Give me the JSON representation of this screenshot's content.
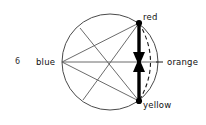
{
  "figure": {
    "number": "6",
    "type": "diagram"
  },
  "labels": {
    "red": "red",
    "yellow": "yellow",
    "orange": "orange",
    "blue": "blue"
  },
  "colors": {
    "stroke": "#1a1a1a",
    "thin_stroke": "#555555",
    "background": "#ffffff",
    "text": "#111111"
  },
  "geometry": {
    "circle": {
      "cx": 110,
      "cy": 62,
      "r": 48
    },
    "nodes": [
      {
        "name": "red",
        "x": 139,
        "y": 23,
        "marker": "filled-dot"
      },
      {
        "name": "yellow",
        "x": 139,
        "y": 101,
        "marker": "filled-dot"
      },
      {
        "name": "orange",
        "x": 158,
        "y": 62,
        "marker": "tick"
      },
      {
        "name": "blue",
        "x": 62,
        "y": 62,
        "marker": "none"
      }
    ],
    "chords": [
      {
        "from": "blue",
        "to": "red"
      },
      {
        "from": "blue",
        "to": "yellow"
      },
      {
        "from": "blue",
        "to": "orange"
      },
      {
        "from": "red",
        "to": "lower-left"
      },
      {
        "from": "upper-left",
        "to": "yellow"
      }
    ],
    "arc_dashed": {
      "from": "red",
      "to": "yellow",
      "side": "right"
    },
    "arrow": {
      "orientation": "vertical",
      "style": "double-headed-inward",
      "x": 139,
      "y_top": 23,
      "y_bottom": 101
    }
  }
}
